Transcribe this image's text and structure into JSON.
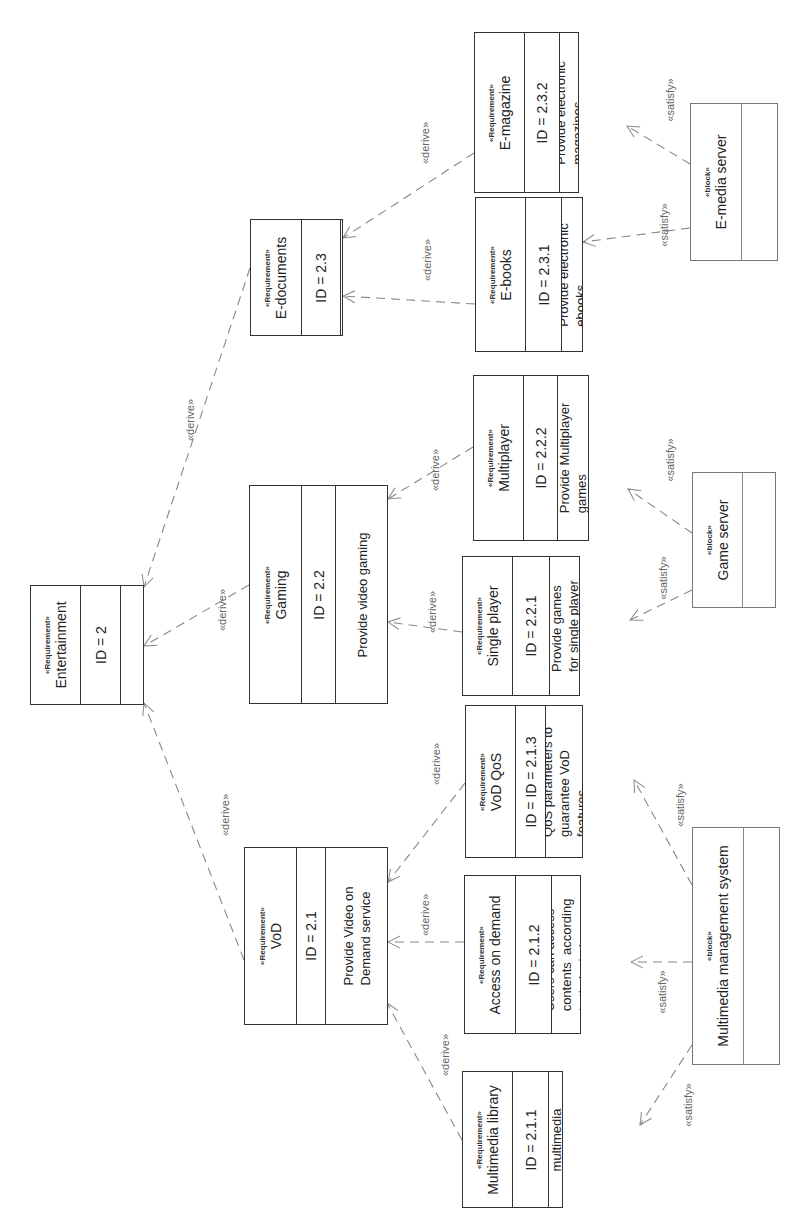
{
  "diagram": {
    "type": "SysML requirement diagram (rotated 90° counter-clockwise)",
    "stereotypes": {
      "requirement": "«Requirement»",
      "block": "«block»"
    },
    "relation_labels": {
      "derive": "«derive»",
      "satisfy": "«satisfy»"
    },
    "requirements": [
      {
        "key": "entertainment",
        "name": "Entertainment",
        "id": "ID = 2",
        "text": ""
      },
      {
        "key": "vod",
        "name": "VoD",
        "id": "ID = 2.1",
        "text": "Provide Video on\nDemand service"
      },
      {
        "key": "gaming",
        "name": "Gaming",
        "id": "ID = 2.2",
        "text": "Provide video gaming"
      },
      {
        "key": "edocuments",
        "name": "E-documents",
        "id": "ID = 2.3",
        "text": ""
      },
      {
        "key": "mmlibrary",
        "name": "Multimedia library",
        "id": "ID = 2.1.1",
        "text": "Provide a\nmultimedia\nlibrary"
      },
      {
        "key": "access",
        "name": "Access on demand",
        "id": "ID = 2.1.2",
        "text": "Users can access\ncontents  according\nto their choice"
      },
      {
        "key": "vodqos",
        "name": "VoD QoS",
        "id": "ID = ID = 2.1.3",
        "text": "QoS parameters to\nguarantee VoD\nfeatures"
      },
      {
        "key": "single",
        "name": "Single player",
        "id": "ID = 2.2.1",
        "text": "Provide games\nfor single player"
      },
      {
        "key": "multi",
        "name": "Multiplayer",
        "id": "ID = 2.2.2",
        "text": "Provide Multiplayer\ngames"
      },
      {
        "key": "ebooks",
        "name": "E-books",
        "id": "ID = 2.3.1",
        "text": "Provide electronic\nebooks"
      },
      {
        "key": "emagazine",
        "name": "E-magazine",
        "id": "ID = 2.3.2",
        "text": "Provide electronic\nmagazines"
      }
    ],
    "blocks": [
      {
        "key": "emedia",
        "name": "E-media server"
      },
      {
        "key": "gameserver",
        "name": "Game server"
      },
      {
        "key": "mms",
        "name": "Multimedia management system"
      }
    ],
    "relations": [
      {
        "type": "derive",
        "from": "vod",
        "to": "entertainment"
      },
      {
        "type": "derive",
        "from": "gaming",
        "to": "entertainment"
      },
      {
        "type": "derive",
        "from": "edocuments",
        "to": "entertainment"
      },
      {
        "type": "derive",
        "from": "mmlibrary",
        "to": "vod"
      },
      {
        "type": "derive",
        "from": "access",
        "to": "vod"
      },
      {
        "type": "derive",
        "from": "vodqos",
        "to": "vod"
      },
      {
        "type": "derive",
        "from": "single",
        "to": "gaming"
      },
      {
        "type": "derive",
        "from": "multi",
        "to": "gaming"
      },
      {
        "type": "derive",
        "from": "ebooks",
        "to": "edocuments"
      },
      {
        "type": "derive",
        "from": "emagazine",
        "to": "edocuments"
      },
      {
        "type": "satisfy",
        "from": "emedia",
        "to": "ebooks"
      },
      {
        "type": "satisfy",
        "from": "emedia",
        "to": "emagazine"
      },
      {
        "type": "satisfy",
        "from": "gameserver",
        "to": "single"
      },
      {
        "type": "satisfy",
        "from": "gameserver",
        "to": "multi"
      },
      {
        "type": "satisfy",
        "from": "mms",
        "to": "mmlibrary"
      },
      {
        "type": "satisfy",
        "from": "mms",
        "to": "access"
      },
      {
        "type": "satisfy",
        "from": "mms",
        "to": "vodqos"
      }
    ]
  }
}
